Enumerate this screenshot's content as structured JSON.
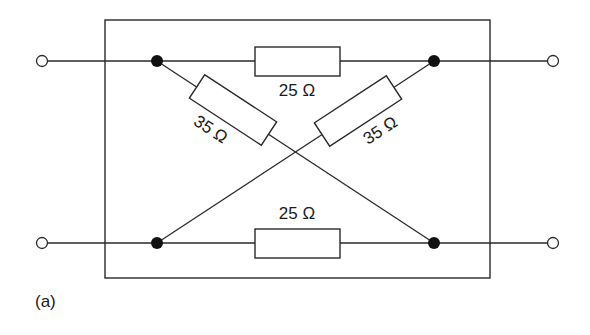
{
  "diagram": {
    "type": "lattice-network",
    "caption": "(a)",
    "resistors": {
      "top": {
        "label": "25 Ω",
        "value_ohms": 25
      },
      "bottom": {
        "label": "25 Ω",
        "value_ohms": 25
      },
      "diagonal_left": {
        "label": "35 Ω",
        "value_ohms": 35
      },
      "diagonal_right": {
        "label": "35 Ω",
        "value_ohms": 35
      }
    },
    "terminals": [
      "input-top",
      "input-bottom",
      "output-top",
      "output-bottom"
    ],
    "nodes": [
      "top-left",
      "top-right",
      "bottom-left",
      "bottom-right"
    ],
    "colors": {
      "line": "#2a2a2a",
      "node": "#111111",
      "background": "#ffffff"
    }
  }
}
